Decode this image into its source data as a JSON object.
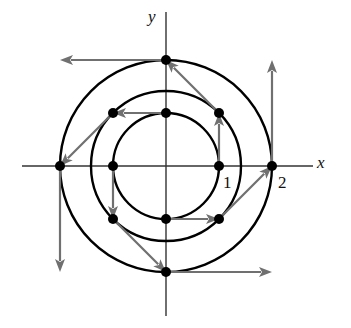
{
  "figure": {
    "axes": {
      "x_label": "x",
      "y_label": "y",
      "tick_labels": [
        "1",
        "2"
      ]
    },
    "colors": {
      "axis": "#333333",
      "circle": "#000000",
      "vector": "#707070",
      "point": "#000000"
    },
    "circles": [
      {
        "name": "inner",
        "radius": 1
      },
      {
        "name": "middle",
        "radius": 1.414
      },
      {
        "name": "outer",
        "radius": 2
      }
    ],
    "points": [
      {
        "x": 1,
        "y": 0,
        "vector": [
          0,
          1
        ]
      },
      {
        "x": 0,
        "y": 1,
        "vector": [
          -1,
          0
        ]
      },
      {
        "x": -1,
        "y": 0,
        "vector": [
          0,
          -1
        ]
      },
      {
        "x": 0,
        "y": -1,
        "vector": [
          1,
          0
        ]
      },
      {
        "x": 1,
        "y": 1,
        "vector": [
          -1,
          1
        ]
      },
      {
        "x": -1,
        "y": 1,
        "vector": [
          -1,
          -1
        ]
      },
      {
        "x": -1,
        "y": -1,
        "vector": [
          1,
          -1
        ]
      },
      {
        "x": 1,
        "y": -1,
        "vector": [
          1,
          1
        ]
      },
      {
        "x": 2,
        "y": 0,
        "vector": [
          0,
          2
        ]
      },
      {
        "x": 0,
        "y": 2,
        "vector": [
          -2,
          0
        ]
      },
      {
        "x": -2,
        "y": 0,
        "vector": [
          0,
          -2
        ]
      },
      {
        "x": 0,
        "y": -2,
        "vector": [
          2,
          0
        ]
      }
    ]
  }
}
